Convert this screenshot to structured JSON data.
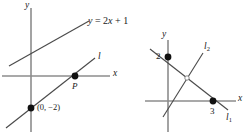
{
  "figure": {
    "colors": {
      "background": "#ffffff",
      "axis": "#8c8c8c",
      "line": "#4a4a4a",
      "point": "#111111",
      "text": "#1a1a1a"
    },
    "panels": [
      {
        "id": "left-panel",
        "name": "line-through-point-P",
        "origin": {
          "x": 31,
          "y": 76
        },
        "axes": {
          "x_label": "x",
          "y_label": "y",
          "x_start": {
            "x": 2,
            "y": 76
          },
          "x_end": {
            "x": 110,
            "y": 76
          },
          "y_start": {
            "x": 31,
            "y": 8
          },
          "y_end": {
            "x": 31,
            "y": 132
          }
        },
        "lines": [
          {
            "name": "line-y-equals-2x-plus-1",
            "label": "y = 2x + 1",
            "label_parts": {
              "lhs": "y",
              "eq": "=",
              "slope": "2",
              "var": "x",
              "plus": "+",
              "intercept": "1"
            },
            "start": {
              "x": 9,
              "y": 66
            },
            "end": {
              "x": 89,
              "y": 21
            }
          },
          {
            "name": "line-l",
            "label": "l",
            "start": {
              "x": 6,
              "y": 128
            },
            "end": {
              "x": 95,
              "y": 58
            }
          }
        ],
        "points": [
          {
            "name": "point-P",
            "label": "P",
            "x": 75,
            "y": 76,
            "label_dx": -3,
            "label_dy": 8
          },
          {
            "name": "point-0-minus-2",
            "label": "(0, −2)",
            "x": 31,
            "y": 108,
            "label_dx": 6,
            "label_dy": -4
          }
        ]
      },
      {
        "id": "right-panel",
        "name": "perpendicular-lines-l1-l2",
        "origin": {
          "x": 168,
          "y": 101
        },
        "axes": {
          "x_label": "x",
          "y_label": "y",
          "x_start": {
            "x": 145,
            "y": 101
          },
          "x_end": {
            "x": 236,
            "y": 101
          },
          "y_start": {
            "x": 168,
            "y": 40
          },
          "y_end": {
            "x": 168,
            "y": 132
          }
        },
        "lines": [
          {
            "name": "line-l1",
            "label": "l",
            "sub": "1",
            "start": {
              "x": 150,
              "y": 49
            },
            "end": {
              "x": 228,
              "y": 110
            }
          },
          {
            "name": "line-l2",
            "label": "l",
            "sub": "2",
            "start": {
              "x": 163,
              "y": 117
            },
            "end": {
              "x": 203,
              "y": 53
            }
          }
        ],
        "points": [
          {
            "name": "point-y-intercept-2",
            "label": "2",
            "x": 168,
            "y": 57,
            "label_dx": -11,
            "label_dy": 4
          },
          {
            "name": "point-x-intercept-3",
            "label": "3",
            "x": 213,
            "y": 101,
            "label_dx": -3,
            "label_dy": 13
          }
        ],
        "intersection_marker": {
          "name": "right-angle-marker",
          "x": 187,
          "y": 78,
          "r": 2.2
        }
      }
    ]
  }
}
